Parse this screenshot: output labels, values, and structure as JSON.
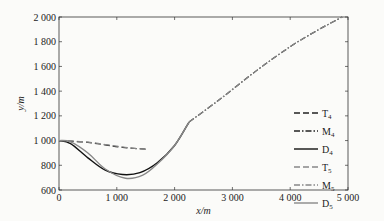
{
  "chart_data": {
    "type": "line",
    "title": "",
    "xlabel": "x/m",
    "ylabel": "y/m",
    "xlim": [
      0,
      5000
    ],
    "ylim": [
      600,
      2000
    ],
    "xticks": [
      "0",
      "1 000",
      "2 000",
      "3 000",
      "4 000",
      "5 000"
    ],
    "yticks": [
      "600",
      "800",
      "1 000",
      "1 200",
      "1 400",
      "1 600",
      "1 800",
      "2 000"
    ],
    "grid": false,
    "legend_position": "right-middle",
    "series": [
      {
        "name": "T4",
        "style": "dashed",
        "color": "#222222",
        "x": [
          0,
          200,
          500,
          800,
          1100,
          1500
        ],
        "y": [
          1000,
          995,
          985,
          965,
          945,
          930
        ]
      },
      {
        "name": "M4",
        "style": "dashdot",
        "color": "#222222",
        "x": [
          2250,
          2800,
          3400,
          4000,
          4500,
          4900
        ],
        "y": [
          1150,
          1340,
          1560,
          1760,
          1900,
          2000
        ]
      },
      {
        "name": "D4",
        "style": "solid",
        "color": "#111111",
        "x": [
          0,
          200,
          500,
          800,
          1100,
          1400,
          1700,
          2000,
          2250
        ],
        "y": [
          1000,
          975,
          860,
          760,
          725,
          740,
          820,
          960,
          1150
        ]
      },
      {
        "name": "T5",
        "style": "dashed",
        "color": "#888888",
        "x": [
          0,
          200,
          500,
          800,
          1100,
          1500
        ],
        "y": [
          1000,
          997,
          988,
          968,
          948,
          928
        ]
      },
      {
        "name": "M5",
        "style": "dashdot",
        "color": "#888888",
        "x": [
          2250,
          2800,
          3400,
          4000,
          4500,
          4900
        ],
        "y": [
          1150,
          1340,
          1560,
          1760,
          1900,
          2000
        ]
      },
      {
        "name": "D5",
        "style": "solid",
        "color": "#888888",
        "x": [
          0,
          200,
          500,
          800,
          1150,
          1450,
          1700,
          2000,
          2250
        ],
        "y": [
          1000,
          990,
          900,
          770,
          695,
          720,
          810,
          960,
          1150
        ]
      }
    ]
  },
  "legend": [
    {
      "base": "T",
      "sub": "4"
    },
    {
      "base": "M",
      "sub": "4"
    },
    {
      "base": "D",
      "sub": "4"
    },
    {
      "base": "T",
      "sub": "5"
    },
    {
      "base": "M",
      "sub": "5"
    },
    {
      "base": "D",
      "sub": "5"
    }
  ]
}
